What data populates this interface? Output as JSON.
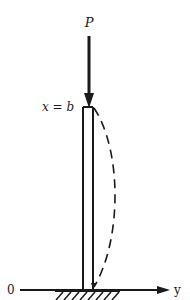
{
  "diagram": {
    "type": "column-buckling",
    "labels": {
      "load": "P",
      "top_position": "x = b",
      "origin": "0",
      "axis": "y"
    },
    "elements": {
      "load_arrow": {
        "x": 89,
        "y_start": 36,
        "y_end": 108
      },
      "column": {
        "left_x": 83,
        "right_x": 93,
        "top_y": 107,
        "bottom_y": 290
      },
      "deflected_shape": {
        "style": "dashed",
        "max_deflection_x": 117,
        "mid_y": 195
      },
      "axis": {
        "y": 290,
        "x_start": 20,
        "x_end": 170
      },
      "ground_hatch": {
        "x_start": 55,
        "x_end": 120
      }
    },
    "colors": {
      "ink": "#1a1a1a",
      "background": "#ffffff"
    }
  }
}
